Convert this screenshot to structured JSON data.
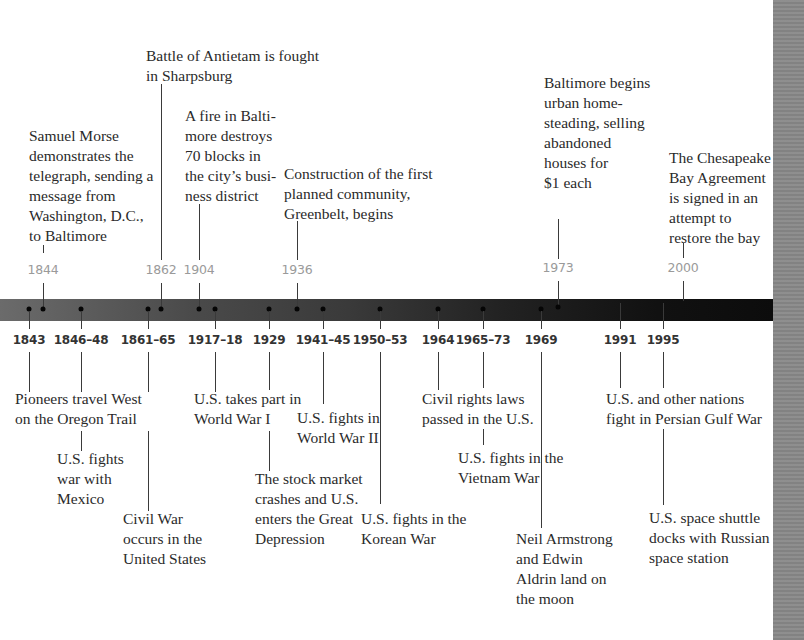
{
  "timeline": {
    "above_events": [
      {
        "year": "1844",
        "text": "Samuel Morse\ndemonstrates the\ntelegraph, sending a\nmessage from\nWashington, D.C.,\nto Baltimore"
      },
      {
        "year": "1862",
        "text": "Battle of Antietam is fought\nin Sharpsburg"
      },
      {
        "year": "1904",
        "text": "A fire in Balti-\nmore destroys\n70 blocks in\nthe city’s busi-\nness district"
      },
      {
        "year": "1936",
        "text": "Construction of the first\nplanned community,\nGreenbelt, begins"
      },
      {
        "year": "1973",
        "text": "Baltimore begins\nurban home-\nsteading, selling\nabandoned\nhouses for\n$1 each"
      },
      {
        "year": "2000",
        "text": "The Chesapeake\nBay Agreement\nis signed in an\nattempt to\nrestore the bay"
      }
    ],
    "below_events": [
      {
        "year": "1843",
        "text": "Pioneers travel West\non the Oregon Trail"
      },
      {
        "year": "1846–48",
        "text": "U.S. fights\nwar with\nMexico"
      },
      {
        "year": "1861–65",
        "text": "Civil War\noccurs in the\nUnited States"
      },
      {
        "year": "1917–18",
        "text": "U.S. takes part in\nWorld War I"
      },
      {
        "year": "1929",
        "text": "The stock market\ncrashes and U.S.\nenters the Great\nDepression"
      },
      {
        "year": "1941–45",
        "text": "U.S. fights in\nWorld War II"
      },
      {
        "year": "1950–53",
        "text": "U.S. fights in the\nKorean War"
      },
      {
        "year": "1964",
        "text": "Civil rights laws\npassed in the U.S."
      },
      {
        "year": "1965–73",
        "text": "U.S. fights in the\nVietnam War"
      },
      {
        "year": "1969",
        "text": "Neil Armstrong\nand Edwin\nAldrin land on\nthe moon"
      },
      {
        "year": "1991",
        "text": "U.S. and other nations\nfight in Persian Gulf War"
      },
      {
        "year": "1995",
        "text": "U.S. space shuttle\ndocks with Russian\nspace station"
      }
    ]
  }
}
